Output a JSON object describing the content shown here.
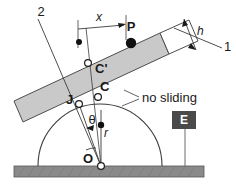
{
  "figure": {
    "colors": {
      "bar_fill": "#c9c9c9",
      "bar_stroke": "#4d4d4d",
      "bar_end_fill": "#ffffff",
      "ground_fill": "#8a8a8a",
      "ground_stroke": "#555555",
      "badge_fill": "#4a4a4a",
      "badge_text": "#ffffff",
      "line": "#3b3b3b",
      "text": "#1a1a1a",
      "node_fill": "#ffffff",
      "dot_fill": "#111111"
    },
    "labels": {
      "axis_2": "2",
      "axis_1": "1",
      "dim_x": "x",
      "dim_h": "h",
      "dim_r": "r",
      "point_P": "P",
      "point_C_prime": "C'",
      "point_C": "C",
      "point_J": "J",
      "point_O": "O",
      "angle_theta": "θ",
      "note_no_sliding": "no sliding",
      "badge_E": "E"
    }
  }
}
